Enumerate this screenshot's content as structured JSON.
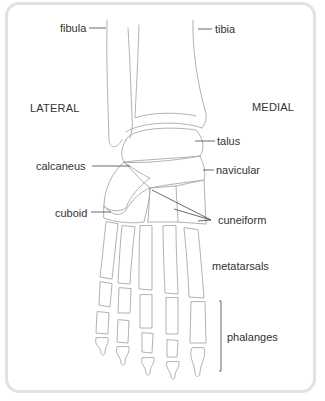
{
  "diagram": {
    "orientation": {
      "lateral": "LATERAL",
      "medial": "MEDIAL"
    },
    "labels": {
      "fibula": "fibula",
      "tibia": "tibia",
      "talus": "talus",
      "calcaneus": "calcaneus",
      "navicular": "navicular",
      "cuboid": "cuboid",
      "cuneiform": "cuneiform",
      "metatarsals": "metatarsals",
      "phalanges": "phalanges"
    },
    "colors": {
      "line": "#a8a8a8",
      "leader": "#444444",
      "text": "#333333",
      "frame": "#e2e2e2"
    }
  }
}
